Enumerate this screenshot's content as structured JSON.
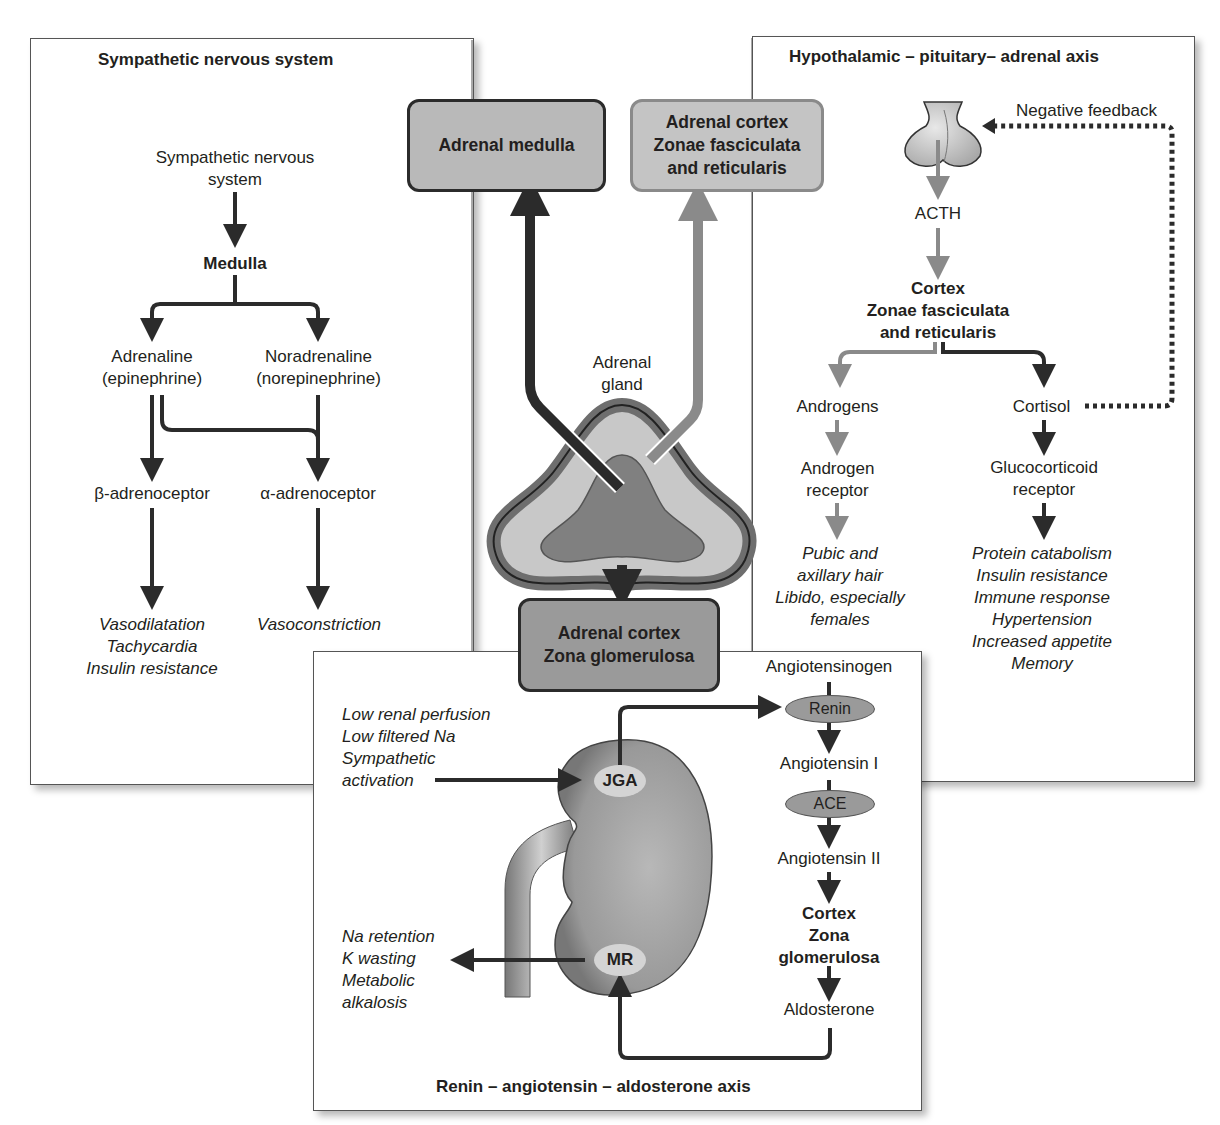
{
  "sympathetic_panel": {
    "title": "Sympathetic nervous system",
    "source_line1": "Sympathetic nervous",
    "source_line2": "system",
    "medulla": "Medulla",
    "adrenaline_line1": "Adrenaline",
    "adrenaline_line2": "(epinephrine)",
    "noradrenaline_line1": "Noradrenaline",
    "noradrenaline_line2": "(norepinephrine)",
    "beta_receptor": "β-adrenoceptor",
    "alpha_receptor": "α-adrenoceptor",
    "beta_effects": [
      "Vasodilatation",
      "Tachycardia",
      "Insulin resistance"
    ],
    "alpha_effects": [
      "Vasoconstriction"
    ]
  },
  "center": {
    "medulla_box": "Adrenal medulla",
    "cortex_fr_box": [
      "Adrenal cortex",
      "Zonae fasciculata",
      "and reticularis"
    ],
    "gland_label_line1": "Adrenal",
    "gland_label_line2": "gland",
    "cortex_zg_box": [
      "Adrenal cortex",
      "Zona glomerulosa"
    ]
  },
  "hpa_panel": {
    "title": "Hypothalamic – pituitary– adrenal axis",
    "negative_feedback": "Negative feedback",
    "acth": "ACTH",
    "cortex": [
      "Cortex",
      "Zonae fasciculata",
      "and reticularis"
    ],
    "androgens": "Androgens",
    "androgen_receptor": [
      "Androgen",
      "receptor"
    ],
    "androgen_effects": [
      "Pubic and",
      "axillary hair",
      "Libido, especially",
      "females"
    ],
    "cortisol": "Cortisol",
    "glucocorticoid_receptor": [
      "Glucocorticoid",
      "receptor"
    ],
    "cortisol_effects": [
      "Protein catabolism",
      "Insulin resistance",
      "Immune response",
      "Hypertension",
      "Increased appetite",
      "Memory"
    ]
  },
  "raa_panel": {
    "title": "Renin – angiotensin – aldosterone axis",
    "stimuli": [
      "Low renal perfusion",
      "Low filtered Na",
      "Sympathetic",
      "activation"
    ],
    "jga": "JGA",
    "mr": "MR",
    "mr_effects": [
      "Na retention",
      "K wasting",
      "Metabolic",
      "alkalosis"
    ],
    "angiotensinogen": "Angiotensinogen",
    "renin": "Renin",
    "angiotensin1": "Angiotensin I",
    "ace": "ACE",
    "angiotensin2": "Angiotensin II",
    "cortex_zg": [
      "Cortex",
      "Zona",
      "glomerulosa"
    ],
    "aldosterone": "Aldosterone"
  },
  "colors": {
    "dark_arrow": "#2b2b2b",
    "grey_arrow": "#8a8a8a",
    "box_fill": "#b9b9b9",
    "box_fill_dark": "#9a9a9a",
    "gland_outer": "#6e6e6e",
    "gland_mid": "#c8c8c8",
    "gland_inner": "#808080"
  }
}
